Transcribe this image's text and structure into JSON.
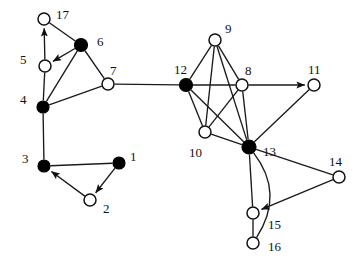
{
  "figure": {
    "type": "node-link-graph",
    "background_color": "#ffffff",
    "node_fill_filled": "#000000",
    "node_fill_hollow": "#ffffff",
    "edge_color": "#1a1a1a",
    "width": 364,
    "height": 261
  },
  "nodes": [
    {
      "id": "1",
      "label": "1",
      "x": 119,
      "y": 163,
      "r": 6.0,
      "style": "filled",
      "label_x": 130,
      "label_y": 150
    },
    {
      "id": "2",
      "label": "2",
      "x": 90,
      "y": 200,
      "r": 6.0,
      "style": "hollow",
      "label_x": 103,
      "label_y": 202
    },
    {
      "id": "3",
      "label": "3",
      "x": 44,
      "y": 166,
      "r": 6.0,
      "style": "filled",
      "label_x": 22,
      "label_y": 152
    },
    {
      "id": "4",
      "label": "4",
      "x": 43,
      "y": 107,
      "r": 6.0,
      "style": "filled",
      "label_x": 20,
      "label_y": 93
    },
    {
      "id": "5",
      "label": "5",
      "x": 45,
      "y": 66,
      "r": 6.0,
      "style": "hollow",
      "label_x": 20,
      "label_y": 53
    },
    {
      "id": "6",
      "label": "6",
      "x": 81,
      "y": 45,
      "r": 6.5,
      "style": "filled",
      "label_x": 97,
      "label_y": 35
    },
    {
      "id": "7",
      "label": "7",
      "x": 108,
      "y": 84,
      "r": 6.0,
      "style": "hollow",
      "label_x": 110,
      "label_y": 64
    },
    {
      "id": "8",
      "label": "8",
      "x": 242,
      "y": 85,
      "r": 6.0,
      "style": "hollow",
      "label_x": 245,
      "label_y": 64
    },
    {
      "id": "9",
      "label": "9",
      "x": 215,
      "y": 40,
      "r": 6.0,
      "style": "hollow",
      "label_x": 225,
      "label_y": 22
    },
    {
      "id": "10",
      "label": "10",
      "x": 205,
      "y": 132,
      "r": 6.0,
      "style": "hollow",
      "label_x": 189,
      "label_y": 146
    },
    {
      "id": "11",
      "label": "11",
      "x": 314,
      "y": 85,
      "r": 6.0,
      "style": "hollow",
      "label_x": 308,
      "label_y": 63
    },
    {
      "id": "12",
      "label": "12",
      "x": 186,
      "y": 85,
      "r": 6.5,
      "style": "filled",
      "label_x": 174,
      "label_y": 63
    },
    {
      "id": "13",
      "label": "13",
      "x": 249,
      "y": 147,
      "r": 7.0,
      "style": "filled",
      "label_x": 263,
      "label_y": 145
    },
    {
      "id": "14",
      "label": "14",
      "x": 339,
      "y": 177,
      "r": 6.0,
      "style": "hollow",
      "label_x": 329,
      "label_y": 155
    },
    {
      "id": "15",
      "label": "15",
      "x": 253,
      "y": 213,
      "r": 6.0,
      "style": "hollow",
      "label_x": 268,
      "label_y": 218
    },
    {
      "id": "16",
      "label": "16",
      "x": 253,
      "y": 243,
      "r": 6.0,
      "style": "hollow",
      "label_x": 268,
      "label_y": 240
    },
    {
      "id": "17",
      "label": "17",
      "x": 44,
      "y": 19,
      "r": 6.0,
      "style": "hollow",
      "label_x": 56,
      "label_y": 8
    }
  ],
  "edges": [
    {
      "source": "5",
      "target": "17",
      "directed": true,
      "curved": false
    },
    {
      "source": "17",
      "target": "6",
      "directed": false,
      "curved": false
    },
    {
      "source": "6",
      "target": "5",
      "directed": true,
      "curved": false
    },
    {
      "source": "6",
      "target": "7",
      "directed": false,
      "curved": false
    },
    {
      "source": "6",
      "target": "4",
      "directed": false,
      "curved": false
    },
    {
      "source": "5",
      "target": "4",
      "directed": false,
      "curved": false
    },
    {
      "source": "4",
      "target": "7",
      "directed": false,
      "curved": false
    },
    {
      "source": "4",
      "target": "3",
      "directed": false,
      "curved": false
    },
    {
      "source": "3",
      "target": "1",
      "directed": false,
      "curved": false
    },
    {
      "source": "1",
      "target": "2",
      "directed": true,
      "curved": false
    },
    {
      "source": "2",
      "target": "3",
      "directed": true,
      "curved": false
    },
    {
      "source": "7",
      "target": "12",
      "directed": false,
      "curved": false
    },
    {
      "source": "12",
      "target": "9",
      "directed": false,
      "curved": false
    },
    {
      "source": "12",
      "target": "8",
      "directed": false,
      "curved": false
    },
    {
      "source": "12",
      "target": "10",
      "directed": false,
      "curved": false
    },
    {
      "source": "12",
      "target": "13",
      "directed": false,
      "curved": false
    },
    {
      "source": "9",
      "target": "8",
      "directed": false,
      "curved": false
    },
    {
      "source": "9",
      "target": "10",
      "directed": false,
      "curved": false
    },
    {
      "source": "9",
      "target": "13",
      "directed": false,
      "curved": false
    },
    {
      "source": "8",
      "target": "11",
      "directed": true,
      "curved": false
    },
    {
      "source": "8",
      "target": "10",
      "directed": false,
      "curved": false
    },
    {
      "source": "8",
      "target": "13",
      "directed": false,
      "curved": false
    },
    {
      "source": "10",
      "target": "13",
      "directed": false,
      "curved": false
    },
    {
      "source": "11",
      "target": "13",
      "directed": false,
      "curved": false
    },
    {
      "source": "13",
      "target": "14",
      "directed": false,
      "curved": false
    },
    {
      "source": "13",
      "target": "15",
      "directed": false,
      "curved": false
    },
    {
      "source": "13",
      "target": "16",
      "directed": false,
      "curved": true,
      "bow": -34
    },
    {
      "source": "14",
      "target": "15",
      "directed": true,
      "curved": false
    },
    {
      "source": "15",
      "target": "16",
      "directed": false,
      "curved": false
    }
  ]
}
